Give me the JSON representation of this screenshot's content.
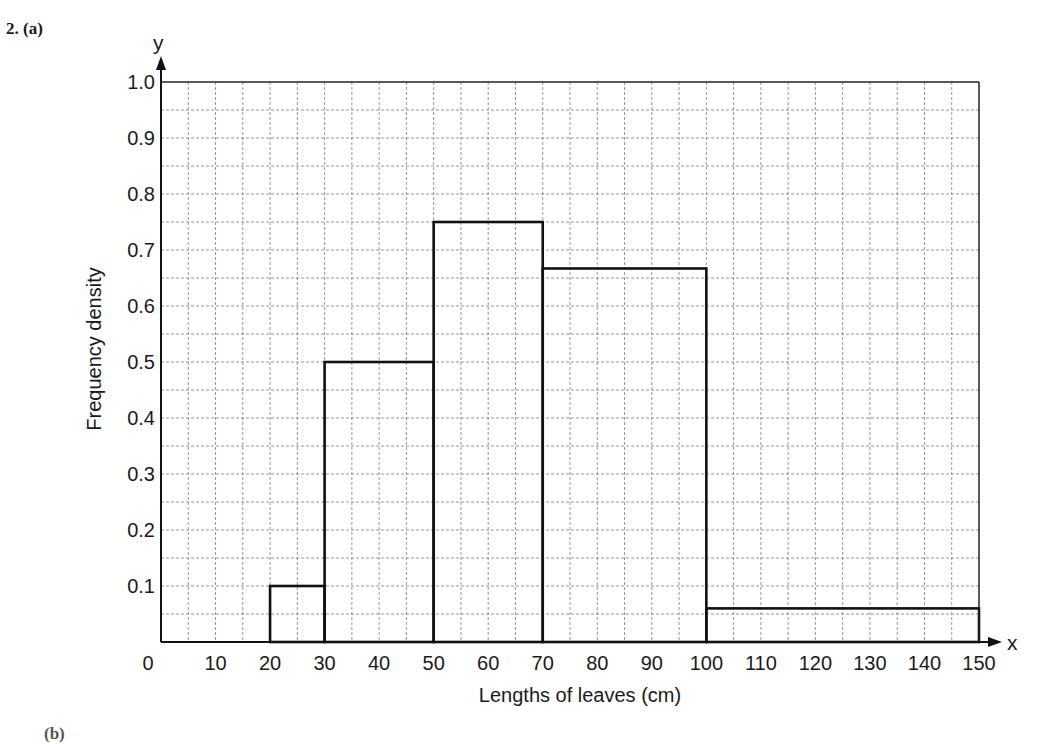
{
  "question": {
    "label": "2.  (a)",
    "next_part_label": "(b)"
  },
  "chart_data": {
    "type": "bar",
    "subtype": "histogram",
    "title": "",
    "xlabel": "Lengths of leaves (cm)",
    "ylabel": "Frequency density",
    "x_axis_letter": "x",
    "y_axis_letter": "y",
    "xlim": [
      0,
      150
    ],
    "ylim": [
      0,
      1.0
    ],
    "x_ticks": [
      0,
      10,
      20,
      30,
      40,
      50,
      60,
      70,
      80,
      90,
      100,
      110,
      120,
      130,
      140,
      150
    ],
    "x_tick_labels": [
      "0",
      "10",
      "20",
      "30",
      "40",
      "50",
      "60",
      "70",
      "80",
      "90",
      "100",
      "110",
      "120",
      "130",
      "140",
      "150"
    ],
    "y_ticks": [
      0.1,
      0.2,
      0.3,
      0.4,
      0.5,
      0.6,
      0.7,
      0.8,
      0.9,
      1.0
    ],
    "y_tick_labels": [
      "0.1",
      "0.2",
      "0.3",
      "0.4",
      "0.5",
      "0.6",
      "0.7",
      "0.8",
      "0.9",
      "1.0"
    ],
    "grid": true,
    "grid_minor_x": 5,
    "grid_minor_y": 0.05,
    "legend": null,
    "bins": [
      {
        "from": 20,
        "to": 30,
        "frequency_density": 0.1
      },
      {
        "from": 30,
        "to": 50,
        "frequency_density": 0.5
      },
      {
        "from": 50,
        "to": 70,
        "frequency_density": 0.75
      },
      {
        "from": 70,
        "to": 100,
        "frequency_density": 0.667
      },
      {
        "from": 100,
        "to": 150,
        "frequency_density": 0.06
      }
    ],
    "categories": [
      "20-30",
      "30-50",
      "50-70",
      "70-100",
      "100-150"
    ],
    "values": [
      0.1,
      0.5,
      0.75,
      0.667,
      0.06
    ]
  }
}
